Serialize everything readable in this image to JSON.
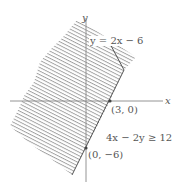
{
  "diagram": {
    "type": "linear-inequality-graph",
    "inequality_label": "4x − 2y ≥ 12",
    "boundary_label": "y = 2x − 6",
    "axis_labels": {
      "x": "x",
      "y": "y"
    },
    "points": [
      {
        "label": "(3, 0)",
        "x": 3,
        "y": 0
      },
      {
        "label": "(0, −6)",
        "x": 0,
        "y": -6
      }
    ],
    "boundary_line": {
      "slope": 2,
      "intercept": -6,
      "style": "solid"
    },
    "shading": "hatched",
    "colors": {
      "axis": "#888888",
      "boundary": "#555555",
      "hatch": "#9a9a9a",
      "text": "#555555",
      "background": "#ffffff"
    }
  }
}
